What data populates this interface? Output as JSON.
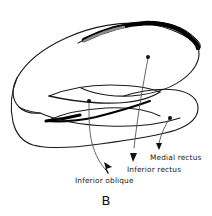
{
  "figure": {
    "caption": "B",
    "type": "anatomical-line-drawing",
    "background_color": "#ffffff",
    "ink_color": "#1a1a1a",
    "thick_stroke_color": "#000000"
  },
  "labels": [
    {
      "id": "inferior-oblique",
      "text": "Inferior oblique",
      "text_x": 75,
      "text_y": 177,
      "dot_x": 89,
      "dot_y": 101,
      "arrow_tip_x": 108,
      "arrow_tip_y": 174
    },
    {
      "id": "inferior-rectus",
      "text": "Inferior rectus",
      "text_x": 127,
      "text_y": 166,
      "dot_x": 148,
      "dot_y": 57,
      "arrow_tip_x": 133,
      "arrow_tip_y": 163
    },
    {
      "id": "medial-rectus",
      "text": "Medial rectus",
      "text_x": 150,
      "text_y": 154,
      "dot_x": 170,
      "dot_y": 118,
      "arrow_tip_x": 159,
      "arrow_tip_y": 151
    }
  ]
}
